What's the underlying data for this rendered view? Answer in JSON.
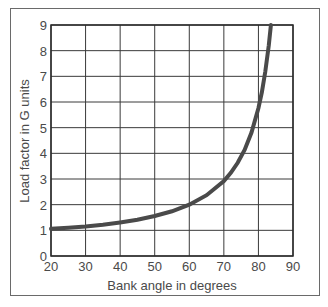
{
  "chart_data": {
    "type": "line",
    "title": "",
    "xlabel": "Bank angle in degrees",
    "ylabel": "Load factor in G units",
    "xlim": [
      20,
      90
    ],
    "ylim": [
      0,
      9
    ],
    "x_ticks": [
      20,
      30,
      40,
      50,
      60,
      70,
      80,
      90
    ],
    "y_ticks": [
      0,
      1,
      2,
      3,
      4,
      5,
      6,
      7,
      8,
      9
    ],
    "grid": true,
    "legend": null,
    "series": [
      {
        "name": "Load factor",
        "x": [
          20,
          25,
          30,
          35,
          40,
          45,
          50,
          55,
          60,
          65,
          70,
          72,
          74,
          76,
          78,
          80,
          81,
          82,
          83,
          83.6
        ],
        "values": [
          1.06,
          1.1,
          1.15,
          1.22,
          1.31,
          1.41,
          1.56,
          1.74,
          2.0,
          2.37,
          2.92,
          3.24,
          3.63,
          4.13,
          4.81,
          5.76,
          6.39,
          7.19,
          8.21,
          9.0
        ]
      }
    ],
    "colors": {
      "curve": "#4a4a4a",
      "grid": "#3a3a3a",
      "frame": "#6a6a6a"
    }
  }
}
